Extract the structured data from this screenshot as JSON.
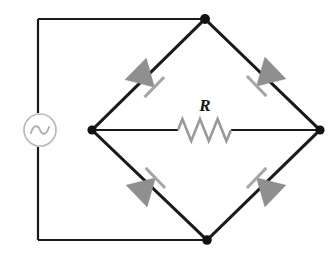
{
  "figure": {
    "kind": "circuit-schematic",
    "name": "full-wave-bridge-rectifier",
    "width": 336,
    "height": 254,
    "background": "#ffffff"
  },
  "labels": {
    "resistor": "R"
  },
  "colors": {
    "wire": "#1a1a1a",
    "node": "#121212",
    "diode_fill": "#8f8f8f",
    "diode_bar": "#a6a6a6",
    "source_outline": "#b9b9b9",
    "resistor": "#9a9a9a"
  },
  "nodes": {
    "top": {
      "x": 205,
      "y": 19
    },
    "left": {
      "x": 92,
      "y": 130
    },
    "right": {
      "x": 320,
      "y": 130
    },
    "bottom": {
      "x": 207,
      "y": 240
    },
    "outer_top_left": {
      "x": 38,
      "y": 19
    },
    "outer_bottom_left": {
      "x": 38,
      "y": 240
    }
  },
  "source": {
    "type": "ac-voltage-source",
    "symbol": "sine",
    "cx": 40,
    "cy": 130,
    "r": 16
  },
  "resistor": {
    "type": "resistor",
    "x_start": 178,
    "x_end": 231,
    "y": 130,
    "peaks": 6,
    "amplitude": 11,
    "label_x": 205,
    "label_y": 111
  },
  "diodes": [
    {
      "name": "diode-top-left",
      "edge": "left-to-top",
      "cx": 145,
      "cy": 78,
      "direction_deg": 224,
      "note": "triangle points down-left toward left node"
    },
    {
      "name": "diode-top-right",
      "edge": "right-to-top",
      "cx": 266,
      "cy": 77,
      "direction_deg": 316,
      "note": "triangle points up-left toward top node"
    },
    {
      "name": "diode-bottom-left",
      "edge": "bottom-to-left",
      "cx": 146,
      "cy": 187,
      "direction_deg": 136,
      "note": "triangle points down-right toward bottom node"
    },
    {
      "name": "diode-bottom-right",
      "edge": "right-to-bottom",
      "cx": 266,
      "cy": 187,
      "direction_deg": 44,
      "note": "triangle points down-left toward bottom node"
    }
  ]
}
